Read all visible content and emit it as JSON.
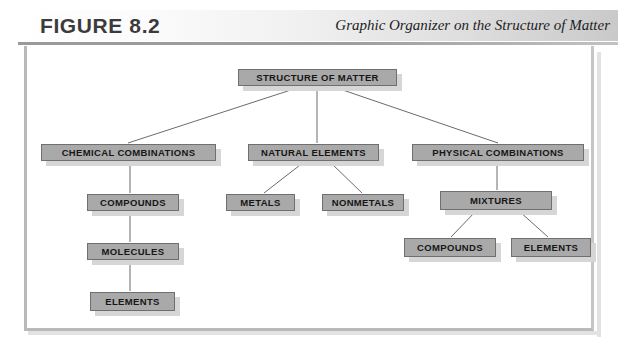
{
  "header": {
    "figure_number": "FIGURE 8.2",
    "caption": "Graphic Organizer on the Structure of Matter"
  },
  "diagram": {
    "type": "hierarchy-tree",
    "nodes": [
      {
        "id": "root",
        "label": "STRUCTURE OF MATTER",
        "x": 238,
        "y": 69,
        "w": 159,
        "h": 17
      },
      {
        "id": "chemcomb",
        "label": "CHEMICAL COMBINATIONS",
        "x": 41,
        "y": 144,
        "w": 175,
        "h": 17
      },
      {
        "id": "natelem",
        "label": "NATURAL ELEMENTS",
        "x": 248,
        "y": 144,
        "w": 131,
        "h": 17
      },
      {
        "id": "physcomb",
        "label": "PHYSICAL COMBINATIONS",
        "x": 412,
        "y": 144,
        "w": 172,
        "h": 17
      },
      {
        "id": "compounds1",
        "label": "COMPOUNDS",
        "x": 87,
        "y": 194,
        "w": 92,
        "h": 17
      },
      {
        "id": "metals",
        "label": "METALS",
        "x": 226,
        "y": 194,
        "w": 69,
        "h": 17
      },
      {
        "id": "nonmetals",
        "label": "NONMETALS",
        "x": 322,
        "y": 194,
        "w": 82,
        "h": 17
      },
      {
        "id": "mixtures",
        "label": "MIXTURES",
        "x": 440,
        "y": 191,
        "w": 112,
        "h": 19
      },
      {
        "id": "molecules",
        "label": "MOLECULES",
        "x": 87,
        "y": 243,
        "w": 92,
        "h": 17
      },
      {
        "id": "compounds2",
        "label": "COMPOUNDS",
        "x": 404,
        "y": 238,
        "w": 92,
        "h": 19
      },
      {
        "id": "elements2",
        "label": "ELEMENTS",
        "x": 511,
        "y": 238,
        "w": 80,
        "h": 19
      },
      {
        "id": "elements1",
        "label": "ELEMENTS",
        "x": 90,
        "y": 292,
        "w": 85,
        "h": 19
      }
    ],
    "edges": [
      {
        "from": "root",
        "to": "chemcomb",
        "x1": 300,
        "y1": 87,
        "x2": 128,
        "y2": 143
      },
      {
        "from": "root",
        "to": "natelem",
        "x1": 317,
        "y1": 87,
        "x2": 317,
        "y2": 143
      },
      {
        "from": "root",
        "to": "physcomb",
        "x1": 334,
        "y1": 87,
        "x2": 498,
        "y2": 143
      },
      {
        "from": "chemcomb",
        "to": "compounds1",
        "x1": 130,
        "y1": 162,
        "x2": 130,
        "y2": 193
      },
      {
        "from": "natelem",
        "to": "metals",
        "x1": 304,
        "y1": 162,
        "x2": 264,
        "y2": 193
      },
      {
        "from": "natelem",
        "to": "nonmetals",
        "x1": 330,
        "y1": 162,
        "x2": 362,
        "y2": 193
      },
      {
        "from": "physcomb",
        "to": "mixtures",
        "x1": 497,
        "y1": 162,
        "x2": 497,
        "y2": 190
      },
      {
        "from": "compounds1",
        "to": "molecules",
        "x1": 130,
        "y1": 212,
        "x2": 130,
        "y2": 242
      },
      {
        "from": "mixtures",
        "to": "compounds2",
        "x1": 476,
        "y1": 211,
        "x2": 451,
        "y2": 237
      },
      {
        "from": "mixtures",
        "to": "elements2",
        "x1": 519,
        "y1": 211,
        "x2": 548,
        "y2": 237
      },
      {
        "from": "molecules",
        "to": "elements1",
        "x1": 130,
        "y1": 261,
        "x2": 130,
        "y2": 291
      }
    ]
  },
  "colors": {
    "node_fill": "#a9a9a9",
    "node_border": "#6f6f6f",
    "node_shadow": "#d6d6d6",
    "connector": "#6b6b6b",
    "frame_border": "#b9b9b9"
  }
}
